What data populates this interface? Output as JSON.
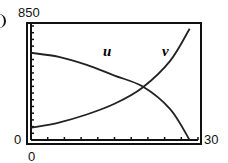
{
  "chart_data": {
    "type": "line",
    "title": "",
    "xlabel": "",
    "ylabel": "",
    "xlim": [
      0,
      30
    ],
    "ylim": [
      0,
      850
    ],
    "grid": false,
    "legend": "none (curves labeled inline)",
    "axis_labels": {
      "y_max": "850",
      "y_min": "0",
      "x_min": "0",
      "x_max": "30"
    },
    "x_ticks_count": 10,
    "y_ticks_count": 17,
    "series": [
      {
        "name": "u",
        "x": [
          0,
          5,
          10,
          15,
          20,
          25,
          28.5
        ],
        "values": [
          650,
          620,
          560,
          480,
          400,
          230,
          0
        ]
      },
      {
        "name": "v",
        "x": [
          0,
          5,
          10,
          15,
          20,
          25,
          28.5
        ],
        "values": [
          90,
          130,
          190,
          270,
          390,
          590,
          830
        ]
      }
    ],
    "intersection": {
      "x": 20.5,
      "y": 400
    }
  },
  "labels": {
    "y_max": "850",
    "y_min": "0",
    "x_min": "0",
    "x_max": "30",
    "series_u": "u",
    "series_v": "v"
  }
}
